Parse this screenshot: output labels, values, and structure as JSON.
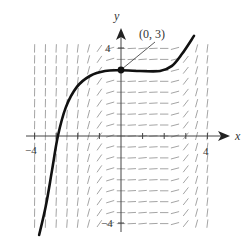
{
  "chart_data": {
    "type": "line",
    "title": "",
    "subtitle": "",
    "xlabel": "x",
    "ylabel": "y",
    "xlim": [
      -4,
      4
    ],
    "ylim": [
      -4,
      4
    ],
    "x_ticks": [
      -4,
      -3,
      -2,
      -1,
      0,
      1,
      2,
      3,
      4
    ],
    "x_tick_labels": [
      {
        "value": -4,
        "label": "−4"
      },
      {
        "value": 4,
        "label": "4"
      }
    ],
    "y_ticks": [
      -4,
      4
    ],
    "y_tick_labels": [
      {
        "value": -4,
        "label": "−4"
      },
      {
        "value": 4,
        "label": "4"
      }
    ],
    "grid": false,
    "legend": null,
    "annotation": {
      "label": "(0, 3)",
      "point": [
        0,
        3
      ]
    },
    "series": [
      {
        "name": "solution curve",
        "x": [
          -3.79,
          -3.47,
          -3.19,
          -2.92,
          -2.55,
          -2.04,
          -1.44,
          -0.74,
          0,
          0.88,
          1.81,
          2.36,
          2.82,
          3.38
        ],
        "y": [
          -4.52,
          -3.15,
          -1.55,
          0.0,
          1.32,
          2.24,
          2.74,
          2.97,
          3.0,
          2.97,
          2.97,
          3.2,
          3.74,
          4.57
        ]
      }
    ],
    "slope_field": {
      "x_range": [
        -4,
        4
      ],
      "y_range": [
        -4,
        4.2
      ],
      "spacing": 0.5,
      "note": "Slopes steep for |x| large, nearly horizontal around 0 ≤ x ≤ 2"
    }
  },
  "labels": {
    "x_axis": "x",
    "y_axis": "y",
    "x_neg": "−4",
    "x_pos": "4",
    "y_pos": "4",
    "y_neg": "−4",
    "point": "(0, 3)"
  },
  "colors": {
    "curve": "#111111",
    "field": "#9a9a9a",
    "axis": "#444444"
  }
}
